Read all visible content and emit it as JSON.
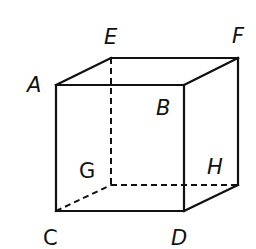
{
  "diagram": {
    "type": "cube",
    "vertices": {
      "A": {
        "x": 56,
        "y": 85
      },
      "B": {
        "x": 184,
        "y": 85
      },
      "C": {
        "x": 56,
        "y": 211
      },
      "D": {
        "x": 184,
        "y": 211
      },
      "E": {
        "x": 111,
        "y": 58
      },
      "F": {
        "x": 238,
        "y": 58
      },
      "G": {
        "x": 111,
        "y": 185
      },
      "H": {
        "x": 238,
        "y": 185
      }
    },
    "labels": {
      "A": "A",
      "B": "B",
      "C": "C",
      "D": "D",
      "E": "E",
      "F": "F",
      "G": "G",
      "H": "H"
    },
    "solid_edges": [
      [
        "A",
        "B"
      ],
      [
        "A",
        "C"
      ],
      [
        "B",
        "D"
      ],
      [
        "C",
        "D"
      ],
      [
        "A",
        "E"
      ],
      [
        "E",
        "F"
      ],
      [
        "B",
        "F"
      ],
      [
        "F",
        "H"
      ],
      [
        "D",
        "H"
      ]
    ],
    "hidden_edges": [
      [
        "E",
        "G"
      ],
      [
        "C",
        "G"
      ],
      [
        "G",
        "H"
      ]
    ],
    "colors": {
      "line": "#111111",
      "background": "#ffffff"
    }
  }
}
